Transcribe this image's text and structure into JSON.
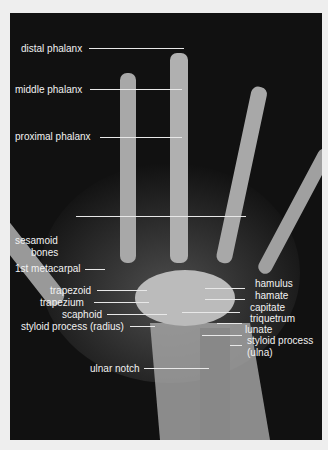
{
  "figure": {
    "labels": {
      "distal_phalanx": "distal phalanx",
      "middle_phalanx": "middle phalanx",
      "proximal_phalanx": "proximal phalanx",
      "sesamoid_bones_1": "sesamoid",
      "sesamoid_bones_2": "bones",
      "first_metacarpal": "1st metacarpal",
      "trapezoid": "trapezoid",
      "trapezium": "trapezium",
      "scaphoid": "scaphoid",
      "styloid_radius": "styloid process (radius)",
      "ulnar_notch": "ulnar notch",
      "hamulus": "hamulus",
      "hamate": "hamate",
      "capitate": "capitate",
      "triquetrum": "triquetrum",
      "lunate": "lunate",
      "styloid_ulna_1": "styloid process",
      "styloid_ulna_2": "(ulna)"
    }
  }
}
